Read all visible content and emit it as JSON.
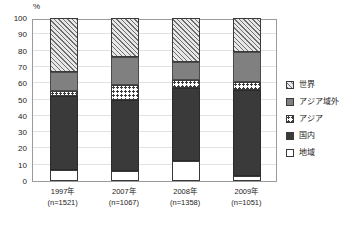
{
  "chart": {
    "type": "bar",
    "unit_label": "%",
    "y_ticks": [
      0,
      10,
      20,
      30,
      40,
      50,
      60,
      70,
      80,
      90,
      100
    ],
    "x_labels": [
      {
        "year": "1997年",
        "n": "(n=1521)"
      },
      {
        "year": "2007年",
        "n": "(n=1067)"
      },
      {
        "year": "2008年",
        "n": "(n=1358)"
      },
      {
        "year": "2009年",
        "n": "(n=1051)"
      }
    ],
    "legend": [
      {
        "label": "世界",
        "swatch": "hatch-swatch"
      },
      {
        "label": "アジア域外",
        "swatch": "gray-swatch"
      },
      {
        "label": "アジア",
        "swatch": "dotted-swatch"
      },
      {
        "label": "国内",
        "swatch": "dark-swatch"
      },
      {
        "label": "地域",
        "swatch": "white-swatch"
      }
    ]
  },
  "chart_data": {
    "type": "bar",
    "stacked": true,
    "stack_order": "bottom-to-top",
    "title": "",
    "xlabel": "",
    "ylabel": "%",
    "ylim": [
      0,
      100
    ],
    "grid": true,
    "legend_position": "right",
    "categories": [
      "1997年",
      "2007年",
      "2008年",
      "2009年"
    ],
    "sample_sizes": [
      "(n=1521)",
      "(n=1067)",
      "(n=1358)",
      "(n=1051)"
    ],
    "series": [
      {
        "name": "地域",
        "values": [
          7,
          6,
          12,
          3
        ]
      },
      {
        "name": "国内",
        "values": [
          45,
          44,
          45,
          53
        ]
      },
      {
        "name": "アジア",
        "values": [
          3,
          9,
          5,
          5
        ]
      },
      {
        "name": "アジア域外",
        "values": [
          12,
          17,
          11,
          18
        ]
      },
      {
        "name": "世界",
        "values": [
          33,
          24,
          27,
          21
        ]
      }
    ],
    "cumulative_tops": {
      "1997年": {
        "地域": 7,
        "国内": 52,
        "アジア": 55,
        "アジア域外": 67,
        "世界": 100
      },
      "2007年": {
        "地域": 6,
        "国内": 50,
        "アジア": 59,
        "アジア域外": 76,
        "世界": 100
      },
      "2008年": {
        "地域": 12,
        "国内": 57,
        "アジア": 62,
        "アジア域外": 73,
        "世界": 100
      },
      "2009年": {
        "地域": 3,
        "国内": 56,
        "アジア": 61,
        "アジア域外": 79,
        "世界": 100
      }
    }
  }
}
